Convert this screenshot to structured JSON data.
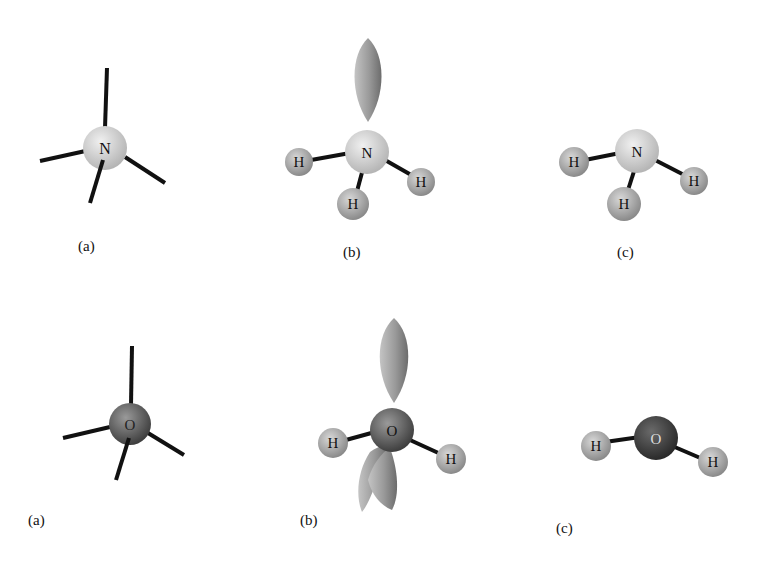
{
  "figure": {
    "rows": [
      {
        "molecule": "ammonia",
        "central_atom": "N",
        "panels": [
          {
            "label": "(a)",
            "description": "tetrahedral electron geometry, four bonds"
          },
          {
            "label": "(b)",
            "description": "one lone pair lobe and three H atoms"
          },
          {
            "label": "(c)",
            "description": "trigonal pyramidal NH3"
          }
        ]
      },
      {
        "molecule": "water",
        "central_atom": "O",
        "panels": [
          {
            "label": "(a)",
            "description": "tetrahedral electron geometry, four bonds"
          },
          {
            "label": "(b)",
            "description": "two lone pair lobes and two H atoms"
          },
          {
            "label": "(c)",
            "description": "bent H2O"
          }
        ]
      }
    ],
    "atoms": {
      "hydrogen": "H",
      "nitrogen": "N",
      "oxygen": "O"
    },
    "colors": {
      "nitrogen": "#cfcfcf",
      "oxygen": "#6a6a6a",
      "hydrogen": "#a8a8a8",
      "bond": "#111111",
      "lobe": "#9a9a9a"
    }
  }
}
